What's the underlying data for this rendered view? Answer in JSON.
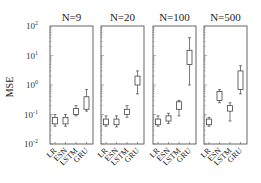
{
  "chart_data": {
    "type": "box",
    "ylabel": "MSE",
    "yscale": "log",
    "ylim": [
      0.01,
      100
    ],
    "yticks": [
      "10^-2",
      "10^-1",
      "10^0",
      "10^1",
      "10^2"
    ],
    "categories": [
      "LR",
      "ESN",
      "LSTM",
      "GRU"
    ],
    "panels": [
      {
        "title": "N=9",
        "boxes": [
          {
            "name": "LR",
            "whisker_low": 0.04,
            "q1": 0.048,
            "median": 0.06,
            "q3": 0.08,
            "whisker_high": 0.1
          },
          {
            "name": "ESN",
            "whisker_low": 0.04,
            "q1": 0.048,
            "median": 0.06,
            "q3": 0.08,
            "whisker_high": 0.1
          },
          {
            "name": "LSTM",
            "whisker_low": 0.09,
            "q1": 0.1,
            "median": 0.12,
            "q3": 0.16,
            "whisker_high": 0.2
          },
          {
            "name": "GRU",
            "whisker_low": 0.13,
            "q1": 0.15,
            "median": 0.3,
            "q3": 0.4,
            "whisker_high": 0.7
          }
        ]
      },
      {
        "title": "N=20",
        "boxes": [
          {
            "name": "LR",
            "whisker_low": 0.04,
            "q1": 0.045,
            "median": 0.06,
            "q3": 0.07,
            "whisker_high": 0.09
          },
          {
            "name": "ESN",
            "whisker_low": 0.038,
            "q1": 0.045,
            "median": 0.06,
            "q3": 0.07,
            "whisker_high": 0.09
          },
          {
            "name": "LSTM",
            "whisker_low": 0.08,
            "q1": 0.1,
            "median": 0.12,
            "q3": 0.15,
            "whisker_high": 0.2
          },
          {
            "name": "GRU",
            "whisker_low": 0.5,
            "q1": 1.0,
            "median": 1.6,
            "q3": 2.0,
            "whisker_high": 3.0
          }
        ]
      },
      {
        "title": "N=100",
        "boxes": [
          {
            "name": "LR",
            "whisker_low": 0.04,
            "q1": 0.045,
            "median": 0.06,
            "q3": 0.07,
            "whisker_high": 0.09
          },
          {
            "name": "ESN",
            "whisker_low": 0.05,
            "q1": 0.06,
            "median": 0.07,
            "q3": 0.09,
            "whisker_high": 0.11
          },
          {
            "name": "LSTM",
            "whisker_low": 0.09,
            "q1": 0.15,
            "median": 0.2,
            "q3": 0.27,
            "whisker_high": 0.3
          },
          {
            "name": "GRU",
            "whisker_low": 1.0,
            "q1": 5.0,
            "median": 8.0,
            "q3": 15.0,
            "whisker_high": 40.0
          }
        ]
      },
      {
        "title": "N=500",
        "boxes": [
          {
            "name": "LR",
            "whisker_low": 0.04,
            "q1": 0.045,
            "median": 0.055,
            "q3": 0.07,
            "whisker_high": 0.08
          },
          {
            "name": "ESN",
            "whisker_low": 0.25,
            "q1": 0.3,
            "median": 0.45,
            "q3": 0.6,
            "whisker_high": 0.7
          },
          {
            "name": "LSTM",
            "whisker_low": 0.06,
            "q1": 0.13,
            "median": 0.15,
            "q3": 0.2,
            "whisker_high": 0.25
          },
          {
            "name": "GRU",
            "whisker_low": 0.5,
            "q1": 0.7,
            "median": 1.5,
            "q3": 3.0,
            "whisker_high": 4.5
          }
        ]
      }
    ]
  }
}
